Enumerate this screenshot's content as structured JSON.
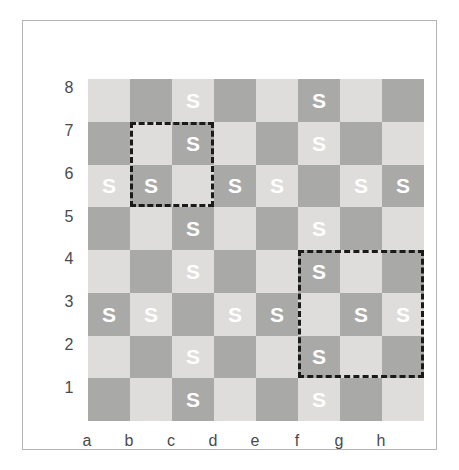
{
  "figure": {
    "kind": "chessboard-diagram",
    "colors": {
      "light_square": "#dedddb",
      "dark_square": "#a9a9a7",
      "mark": "#ffffff",
      "highlight_border": "#1a1a1a",
      "frame_border": "#b4b4b4",
      "label_text": "#4a4a4a"
    }
  },
  "board": {
    "files": [
      "a",
      "b",
      "c",
      "d",
      "e",
      "f",
      "g",
      "h"
    ],
    "ranks": [
      "8",
      "7",
      "6",
      "5",
      "4",
      "3",
      "2",
      "1"
    ],
    "mark_symbol": "S",
    "rows": [
      {
        "rank": "8",
        "cells": [
          {
            "square": "a8",
            "shade": "light",
            "mark": ""
          },
          {
            "square": "b8",
            "shade": "dark",
            "mark": ""
          },
          {
            "square": "c8",
            "shade": "light",
            "mark": "S"
          },
          {
            "square": "d8",
            "shade": "dark",
            "mark": ""
          },
          {
            "square": "e8",
            "shade": "light",
            "mark": ""
          },
          {
            "square": "f8",
            "shade": "dark",
            "mark": "S"
          },
          {
            "square": "g8",
            "shade": "light",
            "mark": ""
          },
          {
            "square": "h8",
            "shade": "dark",
            "mark": ""
          }
        ]
      },
      {
        "rank": "7",
        "cells": [
          {
            "square": "a7",
            "shade": "dark",
            "mark": ""
          },
          {
            "square": "b7",
            "shade": "light",
            "mark": ""
          },
          {
            "square": "c7",
            "shade": "dark",
            "mark": "S"
          },
          {
            "square": "d7",
            "shade": "light",
            "mark": ""
          },
          {
            "square": "e7",
            "shade": "dark",
            "mark": ""
          },
          {
            "square": "f7",
            "shade": "light",
            "mark": "S"
          },
          {
            "square": "g7",
            "shade": "dark",
            "mark": ""
          },
          {
            "square": "h7",
            "shade": "light",
            "mark": ""
          }
        ]
      },
      {
        "rank": "6",
        "cells": [
          {
            "square": "a6",
            "shade": "light",
            "mark": "S"
          },
          {
            "square": "b6",
            "shade": "dark",
            "mark": "S"
          },
          {
            "square": "c6",
            "shade": "light",
            "mark": ""
          },
          {
            "square": "d6",
            "shade": "dark",
            "mark": "S"
          },
          {
            "square": "e6",
            "shade": "light",
            "mark": "S"
          },
          {
            "square": "f6",
            "shade": "dark",
            "mark": ""
          },
          {
            "square": "g6",
            "shade": "light",
            "mark": "S"
          },
          {
            "square": "h6",
            "shade": "dark",
            "mark": "S"
          }
        ]
      },
      {
        "rank": "5",
        "cells": [
          {
            "square": "a5",
            "shade": "dark",
            "mark": ""
          },
          {
            "square": "b5",
            "shade": "light",
            "mark": ""
          },
          {
            "square": "c5",
            "shade": "dark",
            "mark": "S"
          },
          {
            "square": "d5",
            "shade": "light",
            "mark": ""
          },
          {
            "square": "e5",
            "shade": "dark",
            "mark": ""
          },
          {
            "square": "f5",
            "shade": "light",
            "mark": "S"
          },
          {
            "square": "g5",
            "shade": "dark",
            "mark": ""
          },
          {
            "square": "h5",
            "shade": "light",
            "mark": ""
          }
        ]
      },
      {
        "rank": "4",
        "cells": [
          {
            "square": "a4",
            "shade": "light",
            "mark": ""
          },
          {
            "square": "b4",
            "shade": "dark",
            "mark": ""
          },
          {
            "square": "c4",
            "shade": "light",
            "mark": "S"
          },
          {
            "square": "d4",
            "shade": "dark",
            "mark": ""
          },
          {
            "square": "e4",
            "shade": "light",
            "mark": ""
          },
          {
            "square": "f4",
            "shade": "dark",
            "mark": "S"
          },
          {
            "square": "g4",
            "shade": "light",
            "mark": ""
          },
          {
            "square": "h4",
            "shade": "dark",
            "mark": ""
          }
        ]
      },
      {
        "rank": "3",
        "cells": [
          {
            "square": "a3",
            "shade": "dark",
            "mark": "S"
          },
          {
            "square": "b3",
            "shade": "light",
            "mark": "S"
          },
          {
            "square": "c3",
            "shade": "dark",
            "mark": ""
          },
          {
            "square": "d3",
            "shade": "light",
            "mark": "S"
          },
          {
            "square": "e3",
            "shade": "dark",
            "mark": "S"
          },
          {
            "square": "f3",
            "shade": "light",
            "mark": ""
          },
          {
            "square": "g3",
            "shade": "dark",
            "mark": "S"
          },
          {
            "square": "h3",
            "shade": "light",
            "mark": "S"
          }
        ]
      },
      {
        "rank": "2",
        "cells": [
          {
            "square": "a2",
            "shade": "light",
            "mark": ""
          },
          {
            "square": "b2",
            "shade": "dark",
            "mark": ""
          },
          {
            "square": "c2",
            "shade": "light",
            "mark": "S"
          },
          {
            "square": "d2",
            "shade": "dark",
            "mark": ""
          },
          {
            "square": "e2",
            "shade": "light",
            "mark": ""
          },
          {
            "square": "f2",
            "shade": "dark",
            "mark": "S"
          },
          {
            "square": "g2",
            "shade": "light",
            "mark": ""
          },
          {
            "square": "h2",
            "shade": "dark",
            "mark": ""
          }
        ]
      },
      {
        "rank": "1",
        "cells": [
          {
            "square": "a1",
            "shade": "dark",
            "mark": ""
          },
          {
            "square": "b1",
            "shade": "light",
            "mark": ""
          },
          {
            "square": "c1",
            "shade": "dark",
            "mark": "S"
          },
          {
            "square": "d1",
            "shade": "light",
            "mark": ""
          },
          {
            "square": "e1",
            "shade": "dark",
            "mark": ""
          },
          {
            "square": "f1",
            "shade": "light",
            "mark": "S"
          },
          {
            "square": "g1",
            "shade": "dark",
            "mark": ""
          },
          {
            "square": "h1",
            "shade": "light",
            "mark": ""
          }
        ]
      }
    ],
    "highlights": [
      {
        "id": "highlight-b7-c6",
        "label": "2x2 region b7-c6",
        "origin_square": "b7",
        "files_span": [
          "b",
          "c"
        ],
        "ranks_span": [
          "7",
          "6"
        ],
        "width_squares": 2,
        "height_squares": 2
      },
      {
        "id": "highlight-f4-h2",
        "label": "3x3 region f4-h2",
        "origin_square": "f4",
        "files_span": [
          "f",
          "g",
          "h"
        ],
        "ranks_span": [
          "4",
          "3",
          "2"
        ],
        "width_squares": 3,
        "height_squares": 3
      }
    ]
  }
}
